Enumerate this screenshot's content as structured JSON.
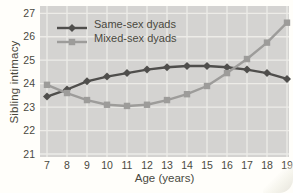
{
  "figure": {
    "background": "#fffefa",
    "text_color": "#4a493f"
  },
  "chart_data": {
    "type": "line",
    "title": "",
    "xlabel": "Age (years)",
    "ylabel": "Sibling intimacy",
    "x": [
      7,
      8,
      9,
      10,
      11,
      12,
      13,
      14,
      15,
      16,
      17,
      18,
      19
    ],
    "xticks": [
      "7",
      "8",
      "9",
      "10",
      "11",
      "12",
      "13",
      "14",
      "15",
      "16",
      "17",
      "18",
      "19"
    ],
    "yticks": [
      "21",
      "22",
      "23",
      "24",
      "25",
      "26",
      "27"
    ],
    "ylim": [
      21,
      27
    ],
    "xlim": [
      7,
      19
    ],
    "grid": true,
    "legend_position": "top-left",
    "plot_bg": "#d4d3d1",
    "grid_color": "#edece8",
    "series": [
      {
        "name": "Same-sex dyads",
        "marker": "diamond",
        "color": "#4f4e4c",
        "values": [
          23.45,
          23.75,
          24.1,
          24.3,
          24.45,
          24.6,
          24.7,
          24.75,
          24.75,
          24.7,
          24.6,
          24.45,
          24.2
        ]
      },
      {
        "name": "Mixed-sex dyads",
        "marker": "square",
        "color": "#9d9c9a",
        "values": [
          23.95,
          23.6,
          23.3,
          23.1,
          23.05,
          23.1,
          23.3,
          23.55,
          23.9,
          24.45,
          25.05,
          25.75,
          26.6
        ]
      }
    ]
  }
}
